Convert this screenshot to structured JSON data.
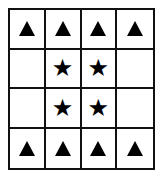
{
  "grid": {
    "rows": 4,
    "cols": 4,
    "cells": [
      [
        "triangle",
        "triangle",
        "triangle",
        "triangle"
      ],
      [
        "empty",
        "star",
        "star",
        "empty"
      ],
      [
        "empty",
        "star",
        "star",
        "empty"
      ],
      [
        "triangle",
        "triangle",
        "triangle",
        "triangle"
      ]
    ]
  },
  "symbols": {
    "star": "★",
    "triangle": "▲",
    "empty": ""
  },
  "colors": {
    "line": "#111111",
    "symbol": "#000000",
    "background": "#ffffff"
  }
}
